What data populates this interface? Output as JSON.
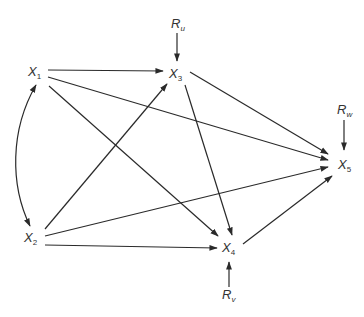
{
  "diagram": {
    "type": "path-diagram",
    "nodes": [
      {
        "id": "X1",
        "base": "X",
        "sub": "1",
        "x": 35,
        "y": 72
      },
      {
        "id": "X2",
        "base": "X",
        "sub": "2",
        "x": 30,
        "y": 240
      },
      {
        "id": "X3",
        "base": "X",
        "sub": "3",
        "x": 176,
        "y": 77
      },
      {
        "id": "X4",
        "base": "X",
        "sub": "4",
        "x": 229,
        "y": 251
      },
      {
        "id": "X5",
        "base": "X",
        "sub": "5",
        "x": 344,
        "y": 168
      },
      {
        "id": "Ru",
        "base": "R",
        "sub": "u",
        "x": 177,
        "y": 26
      },
      {
        "id": "Rv",
        "base": "R",
        "sub": "v",
        "x": 229,
        "y": 300
      },
      {
        "id": "Rw",
        "base": "R",
        "sub": "w",
        "x": 344,
        "y": 110
      }
    ],
    "edges": [
      {
        "from": "X1",
        "to": "X3",
        "type": "directed"
      },
      {
        "from": "X1",
        "to": "X5",
        "type": "directed"
      },
      {
        "from": "X1",
        "to": "X4",
        "type": "directed"
      },
      {
        "from": "X1",
        "to": "X2",
        "type": "bidirected-curved"
      },
      {
        "from": "X2",
        "to": "X3",
        "type": "directed"
      },
      {
        "from": "X2",
        "to": "X5",
        "type": "directed"
      },
      {
        "from": "X2",
        "to": "X4",
        "type": "directed"
      },
      {
        "from": "X3",
        "to": "X5",
        "type": "directed"
      },
      {
        "from": "X3",
        "to": "X4",
        "type": "directed"
      },
      {
        "from": "X4",
        "to": "X5",
        "type": "directed"
      },
      {
        "from": "Ru",
        "to": "X3",
        "type": "directed"
      },
      {
        "from": "Rv",
        "to": "X4",
        "type": "directed"
      },
      {
        "from": "Rw",
        "to": "X5",
        "type": "directed"
      }
    ]
  },
  "labels": {
    "x1": {
      "base": "X",
      "sub": "1"
    },
    "x2": {
      "base": "X",
      "sub": "2"
    },
    "x3": {
      "base": "X",
      "sub": "3"
    },
    "x4": {
      "base": "X",
      "sub": "4"
    },
    "x5": {
      "base": "X",
      "sub": "5"
    },
    "ru": {
      "base": "R",
      "sub": "u"
    },
    "rv": {
      "base": "R",
      "sub": "v"
    },
    "rw": {
      "base": "R",
      "sub": "w"
    }
  }
}
